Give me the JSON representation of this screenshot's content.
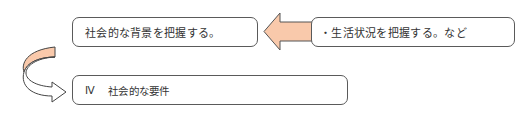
{
  "diagram": {
    "boxes": [
      {
        "id": "background",
        "text": "社会的な背景を把握する。"
      },
      {
        "id": "example",
        "text": "・生活状況を把握する。など"
      },
      {
        "id": "requirement",
        "number": "Ⅳ",
        "text": "社会的な要件"
      }
    ],
    "arrows": [
      {
        "id": "left-arrow",
        "from": "example",
        "to": "background",
        "fill": "#f9c9ab"
      },
      {
        "id": "curved-arrow",
        "from": "background",
        "to": "requirement",
        "fill_top": "#f9c9ab",
        "fill_bottom": "#ffffff"
      }
    ],
    "colors": {
      "box_border": "#5a5a5a",
      "arrow_fill": "#f9c9ab",
      "arrow_stroke": "#444444"
    }
  }
}
